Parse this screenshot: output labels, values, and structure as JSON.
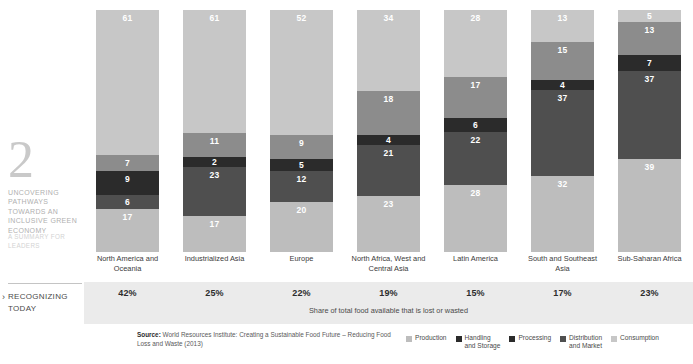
{
  "rail": {
    "number": "2",
    "title": "UNCOVERING PATHWAYS TOWARDS AN INCLUSIVE GREEN ECONOMY",
    "subtitle": "A SUMMARY FOR LEADERS",
    "section_label": "RECOGNIZING TODAY",
    "chevron": "›"
  },
  "band": {
    "caption": "Share of total food available that is lost or wasted"
  },
  "source": {
    "prefix": "Source:",
    "text": " World Resources Institute: Creating a Sustainable Food Future – Reducing Food Loss and Waste (2013)"
  },
  "colors": {
    "production": "#bdbdbd",
    "handling_storage": "#8c8c8c",
    "processing": "#2b2b2b",
    "distribution_market": "#4f4f4f",
    "consumption": "#c7c7c7",
    "band_bg": "#ebebeb"
  },
  "chart_data": {
    "type": "bar",
    "title": "",
    "subtitle": "",
    "xlabel": "",
    "ylabel": "",
    "stacked": true,
    "stack_order_top_to_bottom": [
      "Consumption",
      "Distribution and Market",
      "Processing",
      "Handling and Storage",
      "Production"
    ],
    "grid": false,
    "legend_position": "bottom-right",
    "ylim": [
      0,
      100
    ],
    "categories": [
      "North America and Oceania",
      "Industrialized Asia",
      "Europe",
      "North Africa, West and Central Asia",
      "Latin America",
      "South and Southeast Asia",
      "Sub-Saharan Africa"
    ],
    "series": [
      {
        "name": "Consumption",
        "values": [
          61,
          61,
          52,
          34,
          28,
          13,
          5
        ]
      },
      {
        "name": "Distribution and Market",
        "values": [
          7,
          11,
          9,
          18,
          17,
          15,
          13
        ]
      },
      {
        "name": "Processing",
        "values": [
          9,
          2,
          5,
          4,
          6,
          4,
          7
        ]
      },
      {
        "name": "Handling and Storage",
        "values": [
          6,
          23,
          12,
          21,
          22,
          37,
          37
        ]
      },
      {
        "name": "Production",
        "values": [
          17,
          17,
          20,
          23,
          28,
          32,
          39
        ]
      }
    ],
    "share_lost_or_wasted": [
      "42%",
      "25%",
      "22%",
      "19%",
      "15%",
      "17%",
      "23%"
    ],
    "legend": [
      {
        "label": "Production",
        "color": "#bdbdbd"
      },
      {
        "label": "Handling\nand Storage",
        "color": "#2b2b2b"
      },
      {
        "label": "Processing",
        "color": "#2b2b2b"
      },
      {
        "label": "Distribution\nand Market",
        "color": "#4f4f4f"
      },
      {
        "label": "Consumption",
        "color": "#c7c7c7"
      }
    ]
  }
}
